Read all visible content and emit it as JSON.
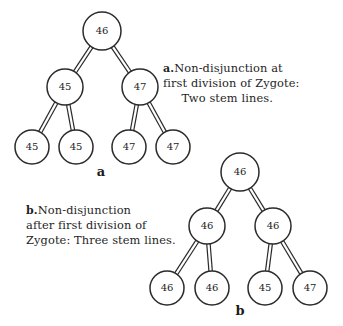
{
  "figure": {
    "background_color": "#ffffff",
    "ink_color": "#2b2b2b"
  },
  "panels": [
    {
      "id": "a",
      "letter": "a",
      "letter_x": 101,
      "letter_y": 176,
      "caption_marker": "a.",
      "caption_lines": [
        "Non-disjunction at",
        "first division of Zygote:",
        "Two stem lines."
      ],
      "caption_text": "a. Non-disjunction at first division of Zygote: Two stem lines."
    },
    {
      "id": "b",
      "letter": "b",
      "letter_x": 240,
      "letter_y": 315,
      "caption_marker": "b.",
      "caption_lines": [
        "Non-disjunction",
        "after first division of",
        "Zygote: Three stem lines."
      ],
      "caption_text": "b. Non-disjunction after first division of Zygote: Three stem lines."
    }
  ],
  "chart_data": {
    "type": "diagram",
    "diagram_kind": "binary-tree-pair",
    "trees": [
      {
        "panel": "a",
        "label": "a",
        "description": "Non-disjunction at first division of Zygote: Two stem lines.",
        "nodes": [
          {
            "id": "a-root",
            "value": "46",
            "cx": 102,
            "cy": 31,
            "r": 19,
            "level": 0
          },
          {
            "id": "a-l",
            "value": "45",
            "cx": 65,
            "cy": 87,
            "r": 18,
            "level": 1
          },
          {
            "id": "a-r",
            "value": "47",
            "cx": 140,
            "cy": 87,
            "r": 18,
            "level": 1
          },
          {
            "id": "a-ll",
            "value": "45",
            "cx": 32,
            "cy": 147,
            "r": 17,
            "level": 2
          },
          {
            "id": "a-lr",
            "value": "45",
            "cx": 76,
            "cy": 147,
            "r": 17,
            "level": 2
          },
          {
            "id": "a-rl",
            "value": "47",
            "cx": 129,
            "cy": 147,
            "r": 17,
            "level": 2
          },
          {
            "id": "a-rr",
            "value": "47",
            "cx": 173,
            "cy": 147,
            "r": 17,
            "level": 2
          }
        ],
        "edges": [
          {
            "from": "a-root",
            "to": "a-l",
            "nondisjunction_tick": true
          },
          {
            "from": "a-root",
            "to": "a-r",
            "nondisjunction_tick": true
          },
          {
            "from": "a-l",
            "to": "a-ll",
            "nondisjunction_tick": false
          },
          {
            "from": "a-l",
            "to": "a-lr",
            "nondisjunction_tick": false
          },
          {
            "from": "a-r",
            "to": "a-rl",
            "nondisjunction_tick": false
          },
          {
            "from": "a-r",
            "to": "a-rr",
            "nondisjunction_tick": false
          }
        ],
        "stem_lines": 2,
        "chromosome_counts": [
          "46",
          "45",
          "47"
        ]
      },
      {
        "panel": "b",
        "label": "b",
        "description": "Non-disjunction after first division of Zygote: Three stem lines.",
        "nodes": [
          {
            "id": "b-root",
            "value": "46",
            "cx": 240,
            "cy": 172,
            "r": 19,
            "level": 0
          },
          {
            "id": "b-l",
            "value": "46",
            "cx": 207,
            "cy": 226,
            "r": 18,
            "level": 1
          },
          {
            "id": "b-r",
            "value": "46",
            "cx": 273,
            "cy": 226,
            "r": 18,
            "level": 1
          },
          {
            "id": "b-ll",
            "value": "46",
            "cx": 167,
            "cy": 288,
            "r": 17,
            "level": 2
          },
          {
            "id": "b-lr",
            "value": "46",
            "cx": 212,
            "cy": 288,
            "r": 17,
            "level": 2
          },
          {
            "id": "b-rl",
            "value": "45",
            "cx": 265,
            "cy": 288,
            "r": 17,
            "level": 2
          },
          {
            "id": "b-rr",
            "value": "47",
            "cx": 310,
            "cy": 288,
            "r": 17,
            "level": 2
          }
        ],
        "edges": [
          {
            "from": "b-root",
            "to": "b-l",
            "nondisjunction_tick": false
          },
          {
            "from": "b-root",
            "to": "b-r",
            "nondisjunction_tick": false
          },
          {
            "from": "b-l",
            "to": "b-ll",
            "nondisjunction_tick": false
          },
          {
            "from": "b-l",
            "to": "b-lr",
            "nondisjunction_tick": false
          },
          {
            "from": "b-r",
            "to": "b-rl",
            "nondisjunction_tick": true
          },
          {
            "from": "b-r",
            "to": "b-rr",
            "nondisjunction_tick": true
          }
        ],
        "stem_lines": 3,
        "chromosome_counts": [
          "46",
          "45",
          "47"
        ]
      }
    ],
    "legend": []
  }
}
